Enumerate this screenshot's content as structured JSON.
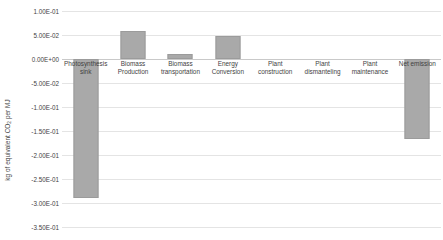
{
  "chart_data": {
    "type": "bar",
    "title": "",
    "xlabel": "",
    "ylabel": "kg of equivalent CO2 per MJ",
    "ylabel_prefix": "kg of equivalent CO",
    "ylabel_subscript": "2",
    "ylabel_suffix": " per MJ",
    "categories": [
      "Photosynthesis sink",
      "Biomass Production",
      "Biomass transportation",
      "Energy Conversion",
      "Plant construction",
      "Plant dismanteling",
      "Plant maintenance",
      "Net emission"
    ],
    "values": [
      -0.29,
      0.058,
      0.0105,
      0.048,
      0.0,
      0.0,
      0.0,
      -0.167
    ],
    "value_labels": [
      "-2.90E-01",
      "5.80E-02",
      "1.05E-02",
      "4.80E-02",
      "0.00E+00",
      "0.00E+00",
      "0.00E+00",
      "-1.67E-01"
    ],
    "ylim": [
      -0.35,
      0.1
    ],
    "yticks": [
      0.1,
      0.05,
      0.0,
      -0.05,
      -0.1,
      -0.15,
      -0.2,
      -0.25,
      -0.3,
      -0.35
    ],
    "ytick_labels": [
      "1.00E-01",
      "5.00E-02",
      "0.00E+00",
      "-5.00E-02",
      "-1.00E-01",
      "-1.50E-01",
      "-2.00E-01",
      "-2.50E-01",
      "-3.00E-01",
      "-3.50E-01"
    ],
    "grid": true,
    "legend": "none",
    "bar_color": "#a9a9a9",
    "gridline_color": "#e4e4e4",
    "text_color": "#3f3f3f"
  }
}
